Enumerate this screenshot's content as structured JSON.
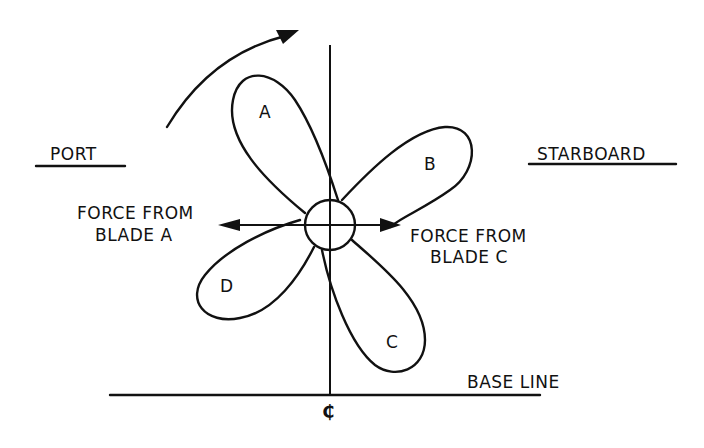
{
  "diagram": {
    "title": "",
    "labels": {
      "port": "PORT",
      "starboard": "STARBOARD",
      "force_a_line1": "FORCE FROM",
      "force_a_line2": "BLADE A",
      "force_c_line1": "FORCE FROM",
      "force_c_line2": "BLADE C",
      "base_line": "BASE LINE",
      "centerline_symbol": "₵"
    },
    "blades": [
      {
        "id": "A",
        "label": "A",
        "position": "upper-left"
      },
      {
        "id": "B",
        "label": "B",
        "position": "upper-right"
      },
      {
        "id": "C",
        "label": "C",
        "position": "lower-right"
      },
      {
        "id": "D",
        "label": "D",
        "position": "lower-left"
      }
    ],
    "elements": {
      "hub": "propeller-hub",
      "rotation": "clockwise",
      "force_a_direction": "toward-port",
      "force_c_direction": "toward-starboard"
    },
    "colors": {
      "ink": "#111111",
      "background": "#ffffff"
    }
  }
}
